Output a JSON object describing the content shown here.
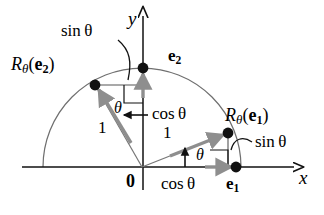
{
  "figure": {
    "kind": "unit-circle-rotation-diagram",
    "colors": {
      "axis": "#111111",
      "arc": "#6b6b6b",
      "ray": "#6b6b6b",
      "gray_arrow": "#8a8a8a",
      "point": "#111111",
      "leader": "#111111",
      "text": "#000000",
      "background": "#ffffff"
    },
    "geometry": {
      "origin": [
        142,
        167
      ],
      "radius": 99,
      "theta_deg": 21,
      "rotated_e1": [
        228,
        133
      ],
      "rotated_e2": [
        95,
        85
      ],
      "e1": [
        236,
        167
      ],
      "e2": [
        143,
        68
      ],
      "x_axis": [
        22,
        167,
        297,
        167
      ],
      "y_axis": [
        143,
        13,
        143,
        190
      ],
      "arc_start_deg": 0,
      "arc_end_deg": 180
    }
  },
  "labels": {
    "axis_x": "x",
    "axis_y": "y",
    "origin": "0",
    "e1": "e",
    "e1_sub": "1",
    "e2": "e",
    "e2_sub": "2",
    "rot_e1_R": "R",
    "rot_e1_theta": "θ",
    "rot_e1_arg_open": "(",
    "rot_e1_arg": "e",
    "rot_e1_arg_sub": "1",
    "rot_e1_arg_close": ")",
    "rot_e2_R": "R",
    "rot_e2_theta": "θ",
    "rot_e2_arg_open": "(",
    "rot_e2_arg": "e",
    "rot_e2_arg_sub": "2",
    "rot_e2_arg_close": ")",
    "sin_theta_top": "sin θ",
    "sin_theta_right": "sin θ",
    "cos_theta_vertical": "cos θ",
    "cos_theta_horizontal": "cos θ",
    "unit_left": "1",
    "unit_right": "1",
    "angle_left": "θ",
    "angle_right": "θ"
  }
}
